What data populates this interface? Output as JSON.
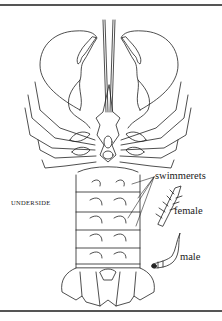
{
  "figure": {
    "labels": {
      "view": "UNDERSIDE",
      "swimmerets": "swimmerets",
      "female": "female",
      "male": "male"
    },
    "colors": {
      "line": "#222222",
      "rule": "#555555",
      "background": "#ffffff"
    }
  }
}
